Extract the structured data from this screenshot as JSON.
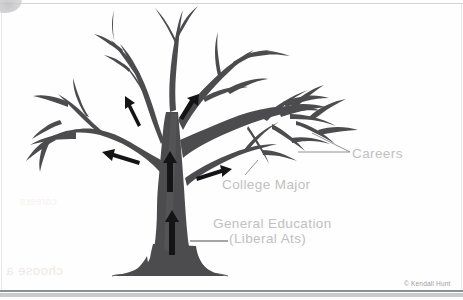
{
  "figure": {
    "type": "labeled-illustration"
  },
  "labels": {
    "careers": "Careers",
    "college_major": "College Major",
    "general_education_line1": "General Education",
    "general_education_line2": "(Liberal Ats)"
  },
  "credit": {
    "text": "© Kendall Hunt"
  },
  "ghost": {
    "bleed_text_1": "choose a",
    "bleed_text_2": "careers"
  },
  "colors": {
    "tree": "#4c4c4e",
    "tree_shade": "#5d5d60",
    "label_text": "#bfc0c2",
    "leader_line": "#b6b7b9",
    "page_background": "#fefefe",
    "frame_line": "#8e8f93"
  },
  "arrows": {
    "count": 5,
    "direction": "upward-along-branch",
    "meaning": "flow from general education at the trunk base upward through the college major to careers at the branch tips"
  }
}
